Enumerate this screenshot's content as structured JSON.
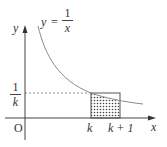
{
  "diagram": {
    "curve_label": {
      "lhs": "y",
      "eq": "=",
      "num": "1",
      "den": "x"
    },
    "axes": {
      "x_label": "x",
      "y_label": "y",
      "origin_label": "O"
    },
    "y_tick": {
      "num": "1",
      "den": "k"
    },
    "x_ticks": [
      "k",
      "k + 1"
    ],
    "colors": {
      "curve": "#8a8a8a",
      "axis": "#444444",
      "rect": "#555555",
      "dash": "#777777",
      "hatch": "#444444"
    }
  }
}
